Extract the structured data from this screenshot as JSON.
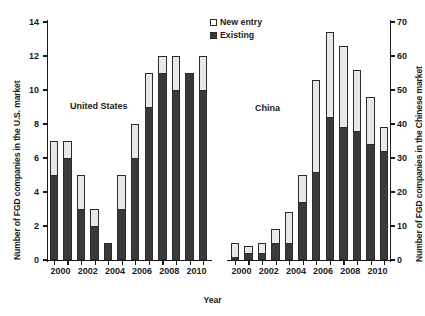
{
  "chart_data": {
    "type": "bar",
    "title": "",
    "subtitle": "",
    "xlabel": "Year",
    "ylabel": "Number of FGD companies in the U.S. market",
    "ylabel_secondary": "Number of FGD companies in the Chinese market",
    "stacked": true,
    "grid": false,
    "legend_position": "top-center",
    "legend": [
      "New entry",
      "Existing"
    ],
    "colors": {
      "new_entry": "#e8e8e8",
      "existing": "#3a3a3a",
      "outline": "#2b2b2b"
    },
    "panels": [
      {
        "name": "United States",
        "annotation": "United States",
        "axis": "left",
        "ylim": [
          0,
          14
        ],
        "yticks": [
          0,
          2,
          4,
          6,
          8,
          10,
          12,
          14
        ],
        "categories": [
          "2000",
          "2001",
          "2002",
          "2003",
          "2004",
          "2005",
          "2006",
          "2007",
          "2008",
          "2009",
          "2010",
          "2011"
        ],
        "tick_labels": [
          "2000",
          "",
          "2002",
          "",
          "2004",
          "",
          "2006",
          "",
          "2008",
          "",
          "2010",
          ""
        ],
        "series": [
          {
            "name": "Existing",
            "values": [
              5,
              6,
              3,
              2,
              1,
              3,
              6,
              9,
              11,
              10,
              11,
              10
            ]
          },
          {
            "name": "New entry",
            "values": [
              2,
              1,
              2,
              1,
              0,
              2,
              2,
              2,
              1,
              2,
              0,
              2
            ]
          }
        ],
        "totals": [
          7,
          7,
          5,
          3,
          1,
          5,
          8,
          11,
          12,
          12,
          11,
          12
        ]
      },
      {
        "name": "China",
        "annotation": "China",
        "axis": "right",
        "ylim": [
          0,
          70
        ],
        "yticks": [
          0,
          10,
          20,
          30,
          40,
          50,
          60,
          70
        ],
        "categories": [
          "2000",
          "2001",
          "2002",
          "2003",
          "2004",
          "2005",
          "2006",
          "2007",
          "2008",
          "2009",
          "2010",
          "2011"
        ],
        "tick_labels": [
          "2000",
          "",
          "2002",
          "",
          "2004",
          "",
          "2006",
          "",
          "2008",
          "",
          "2010",
          ""
        ],
        "series": [
          {
            "name": "Existing",
            "values": [
              1,
              2,
              2,
              5,
              5,
              17,
              26,
              42,
              39,
              38,
              34,
              32
            ]
          },
          {
            "name": "New entry",
            "values": [
              4,
              2,
              3,
              4,
              9,
              8,
              27,
              25,
              24,
              18,
              14,
              7
            ]
          }
        ],
        "totals": [
          5,
          4,
          5,
          9,
          14,
          25,
          53,
          67,
          63,
          56,
          48,
          39
        ]
      }
    ]
  }
}
